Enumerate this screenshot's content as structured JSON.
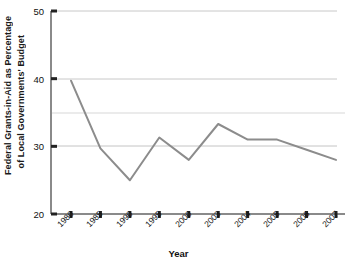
{
  "chart_data": {
    "type": "line",
    "title": "",
    "xlabel": "Year",
    "ylabel": "Federal Grants-in-Aid as Percentage of Local Governments' Budget",
    "ylabel_line1": "Federal Grants-in-Aid as Percentage",
    "ylabel_line2": "of Local Governments' Budget",
    "categories": [
      "1980",
      "1985",
      "1990",
      "1995",
      "2000",
      "2003",
      "2004",
      "2005",
      "2006",
      "2007"
    ],
    "values": [
      39.7,
      29.7,
      25.0,
      31.3,
      28.0,
      33.3,
      31.0,
      31.0,
      29.5,
      28.0
    ],
    "ylim": [
      20,
      50
    ],
    "yticks": [
      20,
      30,
      40,
      50
    ],
    "ytick_labels": [
      "20",
      "30",
      "40",
      "50"
    ],
    "gridlines": [
      30,
      35,
      40,
      50
    ],
    "grid": true,
    "legend": "none",
    "series": [
      {
        "name": "Federal Grants-in-Aid as Percentage of Local Governments' Budget",
        "values": [
          39.7,
          29.7,
          25.0,
          31.3,
          28.0,
          33.3,
          31.0,
          31.0,
          29.5,
          28.0
        ]
      }
    ],
    "colors": {
      "line": "#8c8c8c",
      "axis": "#7a7a7a",
      "grid": "#c8c8c8",
      "grid_faint": "#ebebeb",
      "text": "#111111",
      "background": "#ffffff"
    }
  }
}
